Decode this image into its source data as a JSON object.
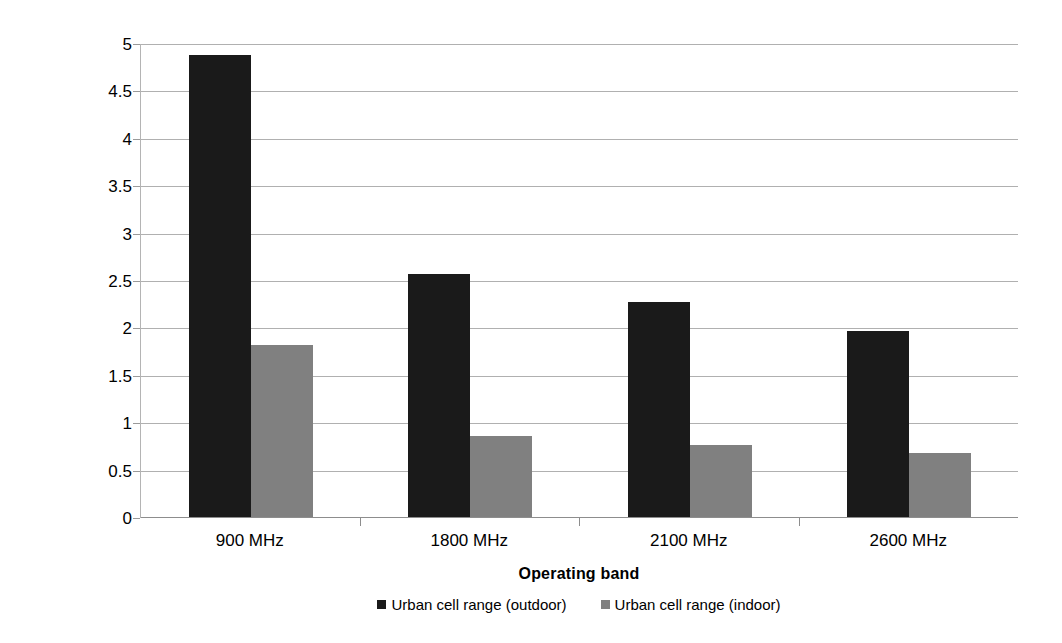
{
  "chart_data": {
    "type": "bar",
    "title": "",
    "xlabel": "Operating band",
    "ylabel": "Cell range [km]",
    "categories": [
      "900 MHz",
      "1800 MHz",
      "2100 MHz",
      "2600 MHz"
    ],
    "series": [
      {
        "name": "Urban cell range (outdoor)",
        "color": "#1a1a1a",
        "values": [
          4.88,
          2.57,
          2.28,
          1.97
        ]
      },
      {
        "name": "Urban cell range (indoor)",
        "color": "#808080",
        "values": [
          1.82,
          0.87,
          0.77,
          0.69
        ]
      }
    ],
    "ylim": [
      0,
      5
    ],
    "ytick_step": 0.5,
    "ytick_labels": [
      "5",
      "4.5",
      "4",
      "3.5",
      "3",
      "2.5",
      "2",
      "1.5",
      "1",
      "0.5",
      "0"
    ],
    "ytick_values": [
      5,
      4.5,
      4,
      3.5,
      3,
      2.5,
      2,
      1.5,
      1,
      0.5,
      0
    ],
    "grid": true,
    "grid_axis": "y",
    "legend_position": "bottom",
    "legend_entries": [
      "Urban cell range (outdoor)",
      "Urban cell range (indoor)"
    ],
    "bar_orientation": "vertical",
    "grouping": "clustered"
  },
  "colors": {
    "outdoor": "#1a1a1a",
    "indoor": "#808080",
    "gridline": "#b0b0b0",
    "axis": "#8d8d8d",
    "background": "#ffffff",
    "text": "#000000"
  }
}
